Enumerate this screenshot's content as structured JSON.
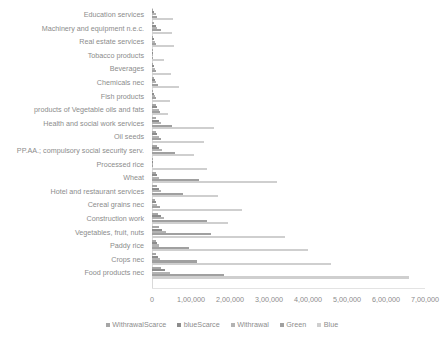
{
  "chart_data": {
    "type": "bar",
    "orientation": "horizontal",
    "title": "",
    "xlabel": "",
    "ylabel": "",
    "xlim": [
      0,
      700000
    ],
    "grid": false,
    "legend_position": "bottom",
    "xticks": [
      "0",
      "1,00,000",
      "2,00,000",
      "3,00,000",
      "4,00,000",
      "5,00,000",
      "6,00,000",
      "7,00,000"
    ],
    "xtick_values": [
      0,
      100000,
      200000,
      300000,
      400000,
      500000,
      600000,
      700000
    ],
    "categories": [
      "Education services",
      "Machinery and equipment n.e.c.",
      "Real estate services",
      "Tobacco products",
      "Beverages",
      "Chemicals nec",
      "Fish products",
      "products of Vegetable oils and fats",
      "Health and social work services",
      "Oil seeds",
      "PP.AA.; compulsory social security serv.",
      "Processed rice",
      "Wheat",
      "Hotel and restaurant services",
      "Cereal grains nec",
      "Construction work",
      "Vegetables, fruit, nuts",
      "Paddy rice",
      "Crops nec",
      "Food products nec"
    ],
    "series": [
      {
        "name": "WithrawalScarce",
        "color": "#a6a6a6",
        "values": [
          3000,
          5000,
          2500,
          600,
          2000,
          4000,
          2500,
          9000,
          11000,
          10000,
          13000,
          1000,
          10000,
          12000,
          8000,
          15000,
          17000,
          9000,
          11000,
          22000
        ]
      },
      {
        "name": "blueScarce",
        "color": "#8c8c8c",
        "values": [
          6000,
          9000,
          5000,
          1200,
          4500,
          7000,
          5000,
          13000,
          17000,
          14000,
          19000,
          1800,
          14000,
          18000,
          11000,
          22000,
          26000,
          13000,
          16000,
          33000
        ]
      },
      {
        "name": "Withrawal",
        "color": "#b3b3b3",
        "values": [
          9000,
          14000,
          8000,
          2000,
          7000,
          11000,
          8000,
          17000,
          22000,
          18000,
          26000,
          2500,
          18000,
          24000,
          14000,
          30000,
          36000,
          17000,
          21000,
          46000
        ]
      },
      {
        "name": "Green",
        "color": "#a0a0a0",
        "values": [
          12000,
          22000,
          11000,
          2500,
          9000,
          16000,
          11000,
          21000,
          52000,
          24000,
          60000,
          3000,
          120000,
          80000,
          20000,
          140000,
          150000,
          95000,
          115000,
          185000
        ]
      },
      {
        "name": "Blue",
        "color": "#cfcfcf",
        "values": [
          55000,
          52000,
          57000,
          30000,
          48000,
          68000,
          47000,
          42000,
          160000,
          133000,
          108000,
          140000,
          320000,
          170000,
          230000,
          195000,
          340000,
          400000,
          460000,
          660000
        ]
      }
    ]
  }
}
